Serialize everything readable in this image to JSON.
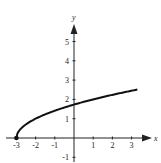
{
  "chart_data": {
    "type": "line",
    "title": "",
    "xlabel": "x",
    "ylabel": "y",
    "xlim": [
      -3.5,
      3.6
    ],
    "ylim": [
      -1.2,
      5.7
    ],
    "x_ticks": [
      "-3",
      "-2",
      "-1",
      "1",
      "2",
      "3"
    ],
    "y_ticks": [
      "-1",
      "1",
      "2",
      "3",
      "4",
      "5"
    ],
    "grid": false,
    "legend": null,
    "series": [
      {
        "name": "y = sqrt(x + 3)",
        "x": [
          -3,
          -2.75,
          -2.5,
          -2,
          -1.5,
          -1,
          -0.5,
          0,
          0.5,
          1,
          1.5,
          2,
          2.5,
          3,
          3.3
        ],
        "values": [
          0,
          0.5,
          0.71,
          1,
          1.22,
          1.41,
          1.58,
          1.73,
          1.87,
          2,
          2.12,
          2.24,
          2.35,
          2.45,
          2.51
        ]
      }
    ],
    "annotations": [
      {
        "type": "closed-dot",
        "x": -3,
        "y": 0
      }
    ]
  },
  "axes": {
    "x_label": "x",
    "y_label": "y"
  }
}
